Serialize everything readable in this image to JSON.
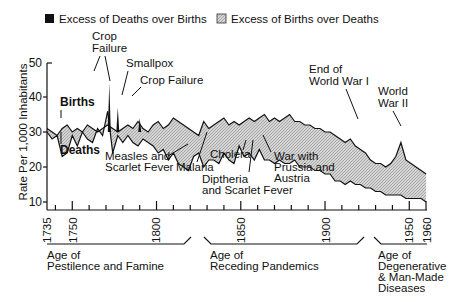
{
  "chart_data": {
    "type": "area",
    "title": "",
    "xlabel": "",
    "ylabel": "Rate Per 1,000 Inhabitants",
    "ylim": [
      7.5,
      50
    ],
    "xlim": [
      1735,
      1960
    ],
    "y_ticks": [
      10,
      20,
      30,
      40,
      50
    ],
    "x_ticks": [
      1735,
      1750,
      1800,
      1850,
      1900,
      1950,
      1960
    ],
    "grid": false,
    "legend": {
      "position": "top",
      "entries": [
        {
          "label": "Excess of Deaths over Births",
          "color": "#111111"
        },
        {
          "label": "Excess of Births over Deaths",
          "color": "#c8c8c8"
        }
      ]
    },
    "series": [
      {
        "name": "Births",
        "x": [
          1735,
          1738,
          1741,
          1744,
          1747,
          1750,
          1753,
          1756,
          1759,
          1762,
          1765,
          1768,
          1771,
          1774,
          1777,
          1780,
          1783,
          1786,
          1789,
          1792,
          1795,
          1798,
          1801,
          1804,
          1807,
          1810,
          1813,
          1816,
          1819,
          1822,
          1825,
          1828,
          1831,
          1834,
          1837,
          1840,
          1843,
          1846,
          1849,
          1852,
          1855,
          1858,
          1861,
          1864,
          1867,
          1870,
          1873,
          1876,
          1879,
          1882,
          1885,
          1888,
          1891,
          1894,
          1897,
          1900,
          1903,
          1906,
          1909,
          1912,
          1915,
          1918,
          1921,
          1924,
          1927,
          1930,
          1933,
          1936,
          1939,
          1942,
          1945,
          1948,
          1951,
          1954,
          1957,
          1960
        ],
        "values": [
          31,
          30,
          29,
          31,
          32,
          30,
          31,
          30,
          32,
          31,
          30,
          31,
          32,
          31,
          30,
          31,
          32,
          31,
          33,
          31,
          30,
          32,
          33,
          31,
          32,
          34,
          33,
          32,
          31,
          30,
          29,
          33,
          31,
          32,
          33,
          34,
          32,
          33,
          32,
          33,
          34,
          33,
          34,
          35,
          33,
          34,
          33,
          34,
          35,
          33,
          33,
          32,
          32,
          31,
          31,
          30,
          30,
          29,
          28,
          27,
          28,
          26,
          25,
          24,
          22,
          21,
          21,
          20,
          21,
          23,
          27,
          22,
          21,
          20,
          19,
          18
        ]
      },
      {
        "name": "Deaths",
        "x": [
          1735,
          1738,
          1741,
          1744,
          1747,
          1750,
          1753,
          1756,
          1759,
          1762,
          1765,
          1768,
          1771,
          1774,
          1777,
          1780,
          1783,
          1786,
          1789,
          1792,
          1795,
          1798,
          1801,
          1804,
          1807,
          1810,
          1813,
          1816,
          1819,
          1822,
          1825,
          1828,
          1831,
          1834,
          1837,
          1840,
          1843,
          1846,
          1849,
          1852,
          1855,
          1858,
          1861,
          1864,
          1867,
          1870,
          1873,
          1876,
          1879,
          1882,
          1885,
          1888,
          1891,
          1894,
          1897,
          1900,
          1903,
          1906,
          1909,
          1912,
          1915,
          1918,
          1921,
          1924,
          1927,
          1930,
          1933,
          1936,
          1939,
          1942,
          1945,
          1948,
          1951,
          1954,
          1957,
          1960
        ],
        "values": [
          30,
          28,
          29,
          23,
          24,
          29,
          26,
          30,
          28,
          27,
          31,
          29,
          36,
          24,
          29,
          27,
          29,
          27,
          26,
          28,
          27,
          26,
          24,
          25,
          22,
          24,
          21,
          20,
          19,
          23,
          24,
          20,
          22,
          22,
          21,
          24,
          22,
          21,
          26,
          23,
          24,
          22,
          25,
          22,
          22,
          21,
          22,
          21,
          21,
          22,
          20,
          20,
          20,
          19,
          19,
          18,
          18,
          16,
          16,
          15,
          16,
          15,
          15,
          14,
          14,
          13,
          13,
          12,
          12,
          12,
          12,
          11,
          11,
          11,
          11,
          10
        ]
      }
    ],
    "annotations": [
      {
        "text": "Births",
        "year": 1741,
        "rate": 37
      },
      {
        "text": "Deaths",
        "year": 1741,
        "rate": 18
      },
      {
        "text": "Crop Failure",
        "year": 1772,
        "rate": 46
      },
      {
        "text": "Smallpox",
        "year": 1783,
        "rate": 39
      },
      {
        "text": "Crop Failure",
        "year": 1787,
        "rate": 36
      },
      {
        "text": "Measles and Scarlet Fever",
        "year": 1810,
        "rate": 18
      },
      {
        "text": "Malaria",
        "year": 1825,
        "rate": 17
      },
      {
        "text": "Cholera",
        "year": 1835,
        "rate": 18
      },
      {
        "text": "Diptheria and Scarlet Fever",
        "year": 1840,
        "rate": 8
      },
      {
        "text": "War with Prussia and Austria",
        "year": 1866,
        "rate": 14
      },
      {
        "text": "End of World War I",
        "year": 1918,
        "rate": 40
      },
      {
        "text": "World War II",
        "year": 1945,
        "rate": 35
      }
    ],
    "eras": [
      {
        "label": "Age of Pestilence and Famine",
        "start": 1735,
        "end": 1815
      },
      {
        "label": "Age of Receding Pandemics",
        "start": 1828,
        "end": 1915
      },
      {
        "label": "Age of Degenerative & Man-Made Diseases",
        "start": 1928,
        "end": 1960
      }
    ]
  },
  "legend": {
    "deaths_excess": "Excess of Deaths over Births",
    "births_excess": "Excess of Births over Deaths"
  },
  "axis": {
    "ylabel": "Rate Per 1,000 Inhabitants",
    "y50": "50",
    "y40": "40",
    "y30": "30",
    "y20": "20",
    "y10": "10",
    "x1735": "1735",
    "x1750": "1750",
    "x1800": "1800",
    "x1850": "1850",
    "x1900": "1900",
    "x1950": "1950",
    "x1960": "1960"
  },
  "labels": {
    "births": "Births",
    "deaths": "Deaths",
    "crop1a": "Crop",
    "crop1b": "Failure",
    "smallpox": "Smallpox",
    "crop2": "Crop Failure",
    "measles1": "Measles and",
    "measles2": "Scarlet Fever",
    "malaria": "Malaria",
    "cholera": "Cholera",
    "dipth1": "Diptheria",
    "dipth2": "and Scarlet Fever",
    "war1": "War with",
    "war2": "Prussia and",
    "war3": "Austria",
    "ww1a": "End of",
    "ww1b": "World War I",
    "ww2a": "World",
    "ww2b": "War II"
  },
  "eras": {
    "e1a": "Age of",
    "e1b": "Pestilence and Famine",
    "e2a": "Age of",
    "e2b": "Receding Pandemics",
    "e3a": "Age of",
    "e3b": "Degenerative",
    "e3c": "& Man-Made",
    "e3d": "Diseases"
  }
}
